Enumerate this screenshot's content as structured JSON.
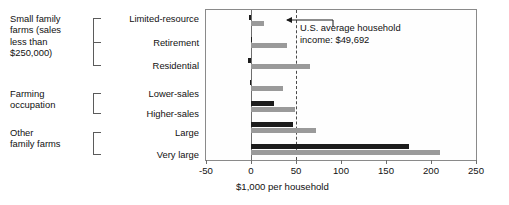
{
  "chart_data": {
    "type": "bar",
    "orientation": "horizontal",
    "title": "",
    "xlabel": "$1,000 per household",
    "ylabel": "",
    "xlim": [
      -50,
      250
    ],
    "xticks": [
      -50,
      0,
      50,
      100,
      150,
      200,
      250
    ],
    "xticklabels": [
      "-50",
      "0",
      "50",
      "100",
      "150",
      "200",
      "250"
    ],
    "grid": false,
    "legend": "none",
    "categories": [
      "Limited-resource",
      "Retirement",
      "Residential",
      "Lower-sales",
      "Higher-sales",
      "Large",
      "Very large"
    ],
    "series": [
      {
        "name": "Farm income",
        "color": "#1c1c1c",
        "values": [
          -2,
          -0.5,
          -3.5,
          -1.5,
          25,
          47,
          175
        ]
      },
      {
        "name": "Total household income",
        "color": "#9a9a9a",
        "values": [
          14,
          40,
          65,
          36,
          49,
          72,
          210
        ]
      }
    ],
    "reference_line": {
      "value": 49.692,
      "style": "dashed",
      "label": "U.S. average household\nincome: $49,692"
    },
    "groups": [
      {
        "label": "Small family\nfarms (sales\nless than\n$250,000)",
        "categories": [
          "Limited-resource",
          "Retirement",
          "Residential"
        ]
      },
      {
        "label": "Farming\noccupation",
        "categories": [
          "Lower-sales",
          "Higher-sales"
        ]
      },
      {
        "label": "Other\nfamily farms",
        "categories": [
          "Large",
          "Very large"
        ]
      }
    ]
  },
  "axis": {
    "x_title": "$1,000 per household",
    "ticks": [
      "-50",
      "0",
      "50",
      "100",
      "150",
      "200",
      "250"
    ]
  },
  "annotation": {
    "text": "U.S. average household\nincome: $49,692"
  },
  "groups": {
    "small_family": "Small family\nfarms (sales\nless than\n$250,000)",
    "farming_occupation": "Farming\noccupation",
    "other_family": "Other\nfamily farms"
  },
  "categories": {
    "limited_resource": "Limited-resource",
    "retirement": "Retirement",
    "residential": "Residential",
    "lower_sales": "Lower-sales",
    "higher_sales": "Higher-sales",
    "large": "Large",
    "very_large": "Very large"
  }
}
